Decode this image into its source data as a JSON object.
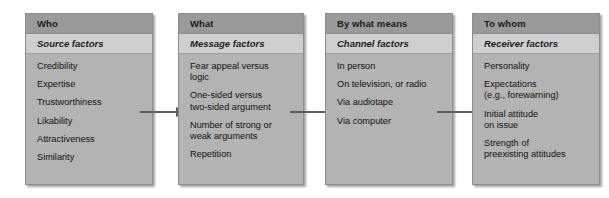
{
  "figure": {
    "background_color": "#ffffff",
    "box_fill": "#b3b3b3",
    "header_fill": "#9a9a9a",
    "subheader_fill": "#cfcfcf",
    "connector_color": "#5d5d5d"
  },
  "boxes": [
    {
      "header": "Who",
      "subheader": "Source factors",
      "items": [
        "Credibility",
        "Expertise",
        "Trustworthiness",
        "Likability",
        "Attractiveness",
        "Similarity"
      ]
    },
    {
      "header": "What",
      "subheader": "Message factors",
      "items": [
        "Fear appeal versus\nlogic",
        "One-sided versus\ntwo-sided argument",
        "Number of strong or\nweak arguments",
        "Repetition"
      ]
    },
    {
      "header": "By what means",
      "subheader": "Channel factors",
      "items": [
        "In person",
        "On television, or radio",
        "Via audiotape",
        "Via computer"
      ]
    },
    {
      "header": "To whom",
      "subheader": "Receiver factors",
      "items": [
        "Personality",
        "Expectations\n(e.g., forewarning)",
        "Initial attitude\non issue",
        "Strength of\npreexisting attitudes"
      ]
    }
  ],
  "connectors": [
    {
      "name": "who-to-what",
      "from": "Who",
      "to": "What"
    },
    {
      "name": "what-to-by-what-means",
      "from": "What",
      "to": "By what means"
    },
    {
      "name": "by-what-means-to-to-whom",
      "from": "By what means",
      "to": "To whom"
    }
  ]
}
